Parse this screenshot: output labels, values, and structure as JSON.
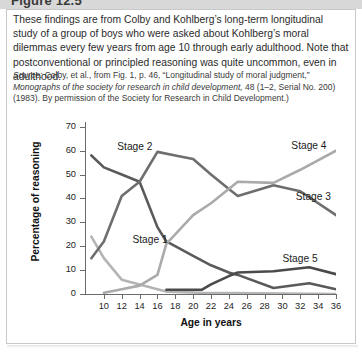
{
  "header": {
    "title": "Figure 12.5"
  },
  "caption": "These findings are from Colby and Kohlberg’s long-term longitudinal study of a group of boys who were asked about Kohlberg’s moral dilemmas every few years from age 10 through early adulthood. Note that postconventional or principled reasoning was quite uncommon, even in adulthood.",
  "source": {
    "label": "Source:",
    "line1": " Colby, et al., from Fig. 1, p. 46, “Longitudinal study of moral judgment,” ",
    "journal": "Monographs of the society for research in child development,",
    "line2": " 48 (1–2, Serial No. 200) (1983). By permission of the Society for Research in Child Development.)"
  },
  "chart_data": {
    "type": "line",
    "title": "",
    "xlabel": "Age in years",
    "ylabel": "Percentage of reasoning",
    "xlim": [
      8,
      36
    ],
    "ylim": [
      0,
      72
    ],
    "grid": false,
    "legend_position": "inline-annotations",
    "xticks": [
      10,
      12,
      14,
      16,
      18,
      20,
      22,
      24,
      26,
      28,
      30,
      32,
      34,
      36
    ],
    "yticks": [
      0,
      10,
      20,
      30,
      40,
      50,
      60,
      70
    ],
    "series": [
      {
        "name": "Stage 1",
        "color": "#b4b4b4",
        "label_x": 13.2,
        "label_y": 22.5,
        "x": [
          8.6,
          10,
          12,
          14,
          16,
          17,
          21,
          36
        ],
        "values": [
          24,
          15,
          6,
          4,
          2,
          1,
          0.5,
          0
        ]
      },
      {
        "name": "Stage 2",
        "color": "#5a5a5a",
        "label_x": 11.5,
        "label_y": 61.5,
        "x": [
          8.6,
          10,
          12,
          14,
          16,
          17,
          20,
          22,
          24,
          25,
          29,
          33,
          36
        ],
        "values": [
          58,
          53,
          50,
          47,
          28,
          22,
          16,
          12,
          9,
          8,
          2.5,
          4.5,
          2
        ]
      },
      {
        "name": "Stage 3",
        "color": "#6e6e6e",
        "label_x": 31.5,
        "label_y": 40.5,
        "x": [
          8.6,
          10,
          12,
          14,
          16,
          18,
          20,
          22,
          24,
          25,
          29,
          32,
          36
        ],
        "values": [
          15,
          22,
          41,
          47,
          59.5,
          58,
          56.5,
          50,
          44,
          41,
          45.5,
          43,
          33
        ]
      },
      {
        "name": "Stage 4",
        "color": "#aaaaaa",
        "label_x": 31.0,
        "label_y": 62.0,
        "x": [
          10,
          12,
          14,
          16,
          17,
          20,
          22,
          25,
          29,
          32,
          36
        ],
        "values": [
          0.5,
          2,
          3.5,
          8,
          21,
          33,
          38,
          47,
          46.5,
          52,
          60
        ]
      },
      {
        "name": "Stage 5",
        "color": "#4a4a4a",
        "label_x": 30.0,
        "label_y": 14.5,
        "x": [
          17,
          18,
          21,
          22,
          24,
          25,
          29,
          33,
          36
        ],
        "values": [
          1.8,
          1.8,
          1.8,
          4,
          7.5,
          9,
          9.5,
          11.2,
          8.3
        ]
      }
    ]
  }
}
